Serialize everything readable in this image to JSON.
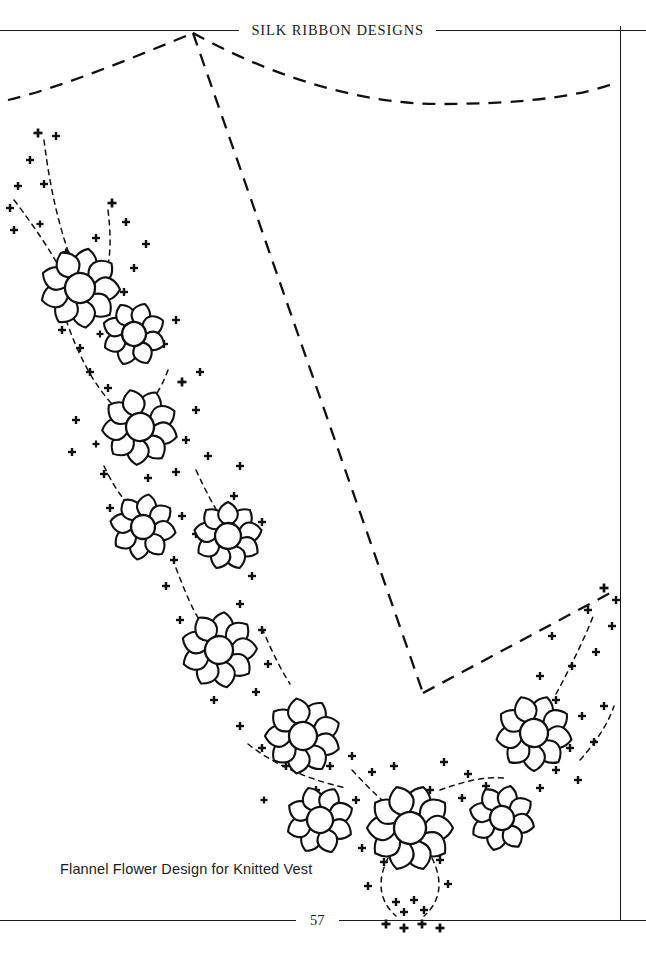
{
  "page": {
    "width": 646,
    "height": 980,
    "background": "#ffffff",
    "ink": "#1a1a1a"
  },
  "header": {
    "title": "SILK RIBBON DESIGNS",
    "rule_left_icon": "horizontal-rule",
    "rule_right_icon": "horizontal-rule"
  },
  "footer": {
    "page_number": "57",
    "rule_left_icon": "horizontal-rule",
    "rule_right_icon": "horizontal-rule"
  },
  "caption": {
    "text": "Flannel Flower Design for Knitted Vest"
  },
  "artwork": {
    "description": "Embroidery transfer pattern: V-neck vest neckline with flannel flower sprays",
    "line_color": "#111111",
    "guides": [
      {
        "name": "left-shoulder-curve",
        "style": "dashed",
        "path": "M 8 100 C 60 88 140 55 193 33"
      },
      {
        "name": "right-shoulder-curve",
        "style": "dashed",
        "path": "M 193 33 C 260 70 350 104 440 104 C 530 104 585 95 618 82"
      },
      {
        "name": "left-neckline-diagonal",
        "style": "dashed",
        "path": "M 193 33 L 423 693"
      },
      {
        "name": "right-neckline-diagonal",
        "style": "dashed",
        "path": "M 423 693 L 612 592"
      }
    ],
    "flowers": [
      {
        "name": "flower-1",
        "cx": 80,
        "cy": 288,
        "r": 40,
        "petals": 9,
        "rotation": 12,
        "core": 15
      },
      {
        "name": "flower-2",
        "cx": 134,
        "cy": 334,
        "r": 32,
        "petals": 8,
        "rotation": 200,
        "core": 12
      },
      {
        "name": "flower-3",
        "cx": 140,
        "cy": 427,
        "r": 38,
        "petals": 9,
        "rotation": 25,
        "core": 14
      },
      {
        "name": "flower-4",
        "cx": 143,
        "cy": 527,
        "r": 33,
        "petals": 8,
        "rotation": 190,
        "core": 12
      },
      {
        "name": "flower-5",
        "cx": 228,
        "cy": 536,
        "r": 34,
        "petals": 9,
        "rotation": 40,
        "core": 13
      },
      {
        "name": "flower-6",
        "cx": 219,
        "cy": 650,
        "r": 38,
        "petals": 9,
        "rotation": 8,
        "core": 14
      },
      {
        "name": "flower-7",
        "cx": 303,
        "cy": 736,
        "r": 38,
        "petals": 9,
        "rotation": 30,
        "core": 14
      },
      {
        "name": "flower-8",
        "cx": 320,
        "cy": 820,
        "r": 34,
        "petals": 8,
        "rotation": 205,
        "core": 13
      },
      {
        "name": "flower-9",
        "cx": 410,
        "cy": 828,
        "r": 43,
        "petals": 10,
        "rotation": 18,
        "core": 16
      },
      {
        "name": "flower-10",
        "cx": 502,
        "cy": 818,
        "r": 33,
        "petals": 8,
        "rotation": 195,
        "core": 12
      },
      {
        "name": "flower-11",
        "cx": 534,
        "cy": 733,
        "r": 38,
        "petals": 9,
        "rotation": 20,
        "core": 14
      }
    ],
    "stems": [
      {
        "name": "stem-left-upper",
        "path": "M 44 140 C 50 190 60 230 72 262"
      },
      {
        "name": "stem-left-outer",
        "path": "M 14 200 C 34 226 50 250 62 272"
      },
      {
        "name": "stem-left-mid",
        "path": "M 108 210 C 112 244 110 262 104 280"
      },
      {
        "name": "stem-left-chain",
        "path": "M 66 320 C 78 354 92 382 112 404"
      },
      {
        "name": "stem-left-chain2",
        "path": "M 168 370 C 160 392 150 404 142 412"
      },
      {
        "name": "stem-mid-chain",
        "path": "M 104 466 C 116 492 128 506 140 514"
      },
      {
        "name": "stem-mid-chain2",
        "path": "M 196 470 C 206 492 214 506 220 516"
      },
      {
        "name": "stem-mid-chain3",
        "path": "M 176 568 C 188 600 198 622 210 634"
      },
      {
        "name": "stem-mid-chain4",
        "path": "M 262 628 C 272 652 280 668 290 684"
      },
      {
        "name": "stem-low-chain",
        "path": "M 248 744 C 276 766 310 780 346 788"
      },
      {
        "name": "stem-low-chain2",
        "path": "M 352 770 C 370 790 386 804 398 814"
      },
      {
        "name": "stem-low-chain3",
        "path": "M 440 790 C 462 782 484 776 504 778"
      },
      {
        "name": "stem-right-chain",
        "path": "M 556 694 C 570 668 584 640 594 614"
      },
      {
        "name": "stem-right-chain2",
        "path": "M 580 760 C 596 742 608 724 614 706"
      },
      {
        "name": "stem-bottom-loop",
        "path": "M 388 858 C 376 882 380 902 396 916"
      },
      {
        "name": "stem-bottom-loop2",
        "path": "M 432 858 C 444 882 440 902 424 916"
      }
    ],
    "crosses": [
      {
        "x": 38,
        "y": 133,
        "s": 9
      },
      {
        "x": 56,
        "y": 136,
        "s": 8
      },
      {
        "x": 30,
        "y": 160,
        "s": 8
      },
      {
        "x": 18,
        "y": 186,
        "s": 8
      },
      {
        "x": 44,
        "y": 184,
        "s": 8
      },
      {
        "x": 10,
        "y": 208,
        "s": 8
      },
      {
        "x": 14,
        "y": 230,
        "s": 8
      },
      {
        "x": 40,
        "y": 224,
        "s": 7
      },
      {
        "x": 112,
        "y": 203,
        "s": 9
      },
      {
        "x": 126,
        "y": 222,
        "s": 8
      },
      {
        "x": 96,
        "y": 238,
        "s": 8
      },
      {
        "x": 146,
        "y": 244,
        "s": 8
      },
      {
        "x": 66,
        "y": 252,
        "s": 7
      },
      {
        "x": 134,
        "y": 268,
        "s": 8
      },
      {
        "x": 124,
        "y": 292,
        "s": 8
      },
      {
        "x": 62,
        "y": 330,
        "s": 8
      },
      {
        "x": 80,
        "y": 348,
        "s": 8
      },
      {
        "x": 100,
        "y": 334,
        "s": 7
      },
      {
        "x": 176,
        "y": 320,
        "s": 8
      },
      {
        "x": 164,
        "y": 344,
        "s": 8
      },
      {
        "x": 90,
        "y": 372,
        "s": 8
      },
      {
        "x": 108,
        "y": 388,
        "s": 8
      },
      {
        "x": 182,
        "y": 382,
        "s": 9
      },
      {
        "x": 200,
        "y": 372,
        "s": 8
      },
      {
        "x": 196,
        "y": 410,
        "s": 8
      },
      {
        "x": 76,
        "y": 420,
        "s": 8
      },
      {
        "x": 72,
        "y": 452,
        "s": 8
      },
      {
        "x": 96,
        "y": 444,
        "s": 7
      },
      {
        "x": 186,
        "y": 440,
        "s": 8
      },
      {
        "x": 208,
        "y": 456,
        "s": 8
      },
      {
        "x": 104,
        "y": 474,
        "s": 8
      },
      {
        "x": 148,
        "y": 478,
        "s": 8
      },
      {
        "x": 176,
        "y": 472,
        "s": 8
      },
      {
        "x": 240,
        "y": 466,
        "s": 8
      },
      {
        "x": 234,
        "y": 496,
        "s": 8
      },
      {
        "x": 110,
        "y": 508,
        "s": 8
      },
      {
        "x": 182,
        "y": 516,
        "s": 8
      },
      {
        "x": 196,
        "y": 534,
        "s": 8
      },
      {
        "x": 262,
        "y": 522,
        "s": 8
      },
      {
        "x": 174,
        "y": 560,
        "s": 8
      },
      {
        "x": 166,
        "y": 586,
        "s": 8
      },
      {
        "x": 252,
        "y": 576,
        "s": 8
      },
      {
        "x": 240,
        "y": 604,
        "s": 8
      },
      {
        "x": 262,
        "y": 630,
        "s": 8
      },
      {
        "x": 180,
        "y": 620,
        "s": 8
      },
      {
        "x": 268,
        "y": 664,
        "s": 8
      },
      {
        "x": 256,
        "y": 692,
        "s": 8
      },
      {
        "x": 214,
        "y": 700,
        "s": 8
      },
      {
        "x": 240,
        "y": 726,
        "s": 8
      },
      {
        "x": 262,
        "y": 748,
        "s": 8
      },
      {
        "x": 286,
        "y": 766,
        "s": 8
      },
      {
        "x": 330,
        "y": 766,
        "s": 8
      },
      {
        "x": 352,
        "y": 756,
        "s": 8
      },
      {
        "x": 372,
        "y": 772,
        "s": 8
      },
      {
        "x": 394,
        "y": 766,
        "s": 8
      },
      {
        "x": 316,
        "y": 790,
        "s": 8
      },
      {
        "x": 356,
        "y": 800,
        "s": 8
      },
      {
        "x": 444,
        "y": 762,
        "s": 8
      },
      {
        "x": 468,
        "y": 774,
        "s": 8
      },
      {
        "x": 462,
        "y": 798,
        "s": 8
      },
      {
        "x": 486,
        "y": 786,
        "s": 8
      },
      {
        "x": 430,
        "y": 790,
        "s": 8
      },
      {
        "x": 540,
        "y": 788,
        "s": 8
      },
      {
        "x": 556,
        "y": 770,
        "s": 8
      },
      {
        "x": 578,
        "y": 780,
        "s": 8
      },
      {
        "x": 570,
        "y": 748,
        "s": 8
      },
      {
        "x": 594,
        "y": 742,
        "s": 8
      },
      {
        "x": 582,
        "y": 716,
        "s": 8
      },
      {
        "x": 604,
        "y": 706,
        "s": 8
      },
      {
        "x": 556,
        "y": 700,
        "s": 8
      },
      {
        "x": 540,
        "y": 676,
        "s": 8
      },
      {
        "x": 572,
        "y": 666,
        "s": 8
      },
      {
        "x": 596,
        "y": 652,
        "s": 8
      },
      {
        "x": 612,
        "y": 626,
        "s": 8
      },
      {
        "x": 588,
        "y": 610,
        "s": 8
      },
      {
        "x": 604,
        "y": 588,
        "s": 9
      },
      {
        "x": 616,
        "y": 600,
        "s": 8
      },
      {
        "x": 552,
        "y": 636,
        "s": 8
      },
      {
        "x": 362,
        "y": 848,
        "s": 8
      },
      {
        "x": 384,
        "y": 862,
        "s": 8
      },
      {
        "x": 440,
        "y": 860,
        "s": 8
      },
      {
        "x": 368,
        "y": 886,
        "s": 8
      },
      {
        "x": 448,
        "y": 884,
        "s": 8
      },
      {
        "x": 396,
        "y": 902,
        "s": 8
      },
      {
        "x": 414,
        "y": 900,
        "s": 8
      },
      {
        "x": 386,
        "y": 924,
        "s": 9
      },
      {
        "x": 404,
        "y": 928,
        "s": 9
      },
      {
        "x": 422,
        "y": 924,
        "s": 9
      },
      {
        "x": 440,
        "y": 928,
        "s": 9
      },
      {
        "x": 404,
        "y": 912,
        "s": 8
      },
      {
        "x": 424,
        "y": 910,
        "s": 8
      },
      {
        "x": 300,
        "y": 812,
        "s": 7
      },
      {
        "x": 264,
        "y": 800,
        "s": 7
      }
    ]
  }
}
